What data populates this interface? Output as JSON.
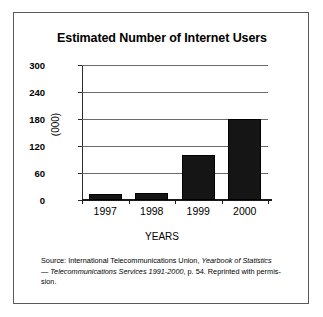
{
  "chart_data": {
    "type": "bar",
    "title": "Estimated Number of Internet Users",
    "xlabel": "YEARS",
    "ylabel": "(000)",
    "categories": [
      "1997",
      "1998",
      "1999",
      "2000"
    ],
    "values": [
      13,
      16,
      100,
      180
    ],
    "ylim": [
      0,
      300
    ],
    "yticks": [
      0,
      60,
      120,
      180,
      240,
      300
    ],
    "ytick_labels": [
      "0",
      "60",
      "120",
      "180",
      "240",
      "300"
    ],
    "grid": true,
    "legend": null,
    "bar_color": "#151515",
    "grid_color": "#6b6b6b",
    "background": "#ffffff"
  },
  "source_note": {
    "line1_plain": "Source: International Telecommunications Union, ",
    "line1_italic": "Yearbook of Statistics",
    "line2_italic": "— Telecommunications Services 1991-2000",
    "line2_plain": ", p. 54. Reprinted with permis-",
    "line3": "sion."
  }
}
